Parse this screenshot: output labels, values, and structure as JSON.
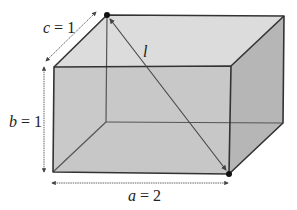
{
  "figure": {
    "type": "rectangular-box-diagonal",
    "labels": {
      "c": "c = 1",
      "c_var": "c",
      "c_val": " = 1",
      "b_var": "b",
      "b_val": " = 1",
      "a_var": "a",
      "a_val": " = 2",
      "l_var": "l"
    },
    "dimensions": {
      "a": 2,
      "b": 1,
      "c": 1
    },
    "colors": {
      "top_face": "#dcdcdc",
      "front_face": "#c8c8c8",
      "right_face": "#b6b6b6",
      "left_face": "#d2d2d2",
      "back_face": "#cbcbcb",
      "edge": "#333333",
      "arrow": "#555555"
    }
  }
}
